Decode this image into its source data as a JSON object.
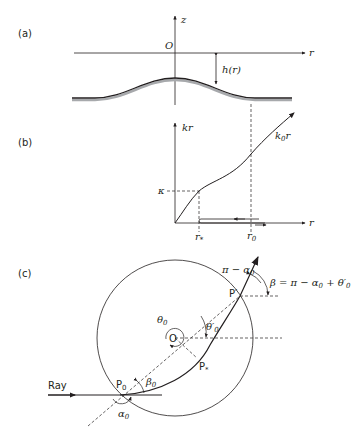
{
  "panels": {
    "a": {
      "label": "(a)",
      "z_axis": "z",
      "r_axis": "r",
      "origin": "O",
      "height_label": "h(r)"
    },
    "b": {
      "label": "(b)",
      "y_axis": "kr",
      "x_axis": "r",
      "kappa": "κ",
      "r_star": "r",
      "r_star_sub": "*",
      "r_zero": "r",
      "r_zero_sub": "0",
      "curve_label_k": "k",
      "curve_label_sub": "0",
      "curve_label_r": "r"
    },
    "c": {
      "label": "(c)",
      "ray": "Ray",
      "center": "O",
      "p0": "P",
      "p0_sub": "0",
      "p_prime": "P′",
      "p_star": "P",
      "p_star_sub": "*",
      "theta0": "θ",
      "theta0_sub": "0",
      "theta0_prime": "θ′",
      "theta0_prime_sub": "0",
      "alpha0": "α",
      "alpha0_sub": "0",
      "beta0": "β",
      "beta0_sub": "0",
      "pi_minus_alpha": "π − α",
      "pi_minus_alpha_sub": "0",
      "beta_eq": "β = π − α",
      "beta_eq_sub1": "0",
      "beta_eq_mid": " + θ′",
      "beta_eq_sub2": "0"
    }
  },
  "colors": {
    "stroke": "#231f20",
    "surface_shadow": "#a7a9ac"
  }
}
